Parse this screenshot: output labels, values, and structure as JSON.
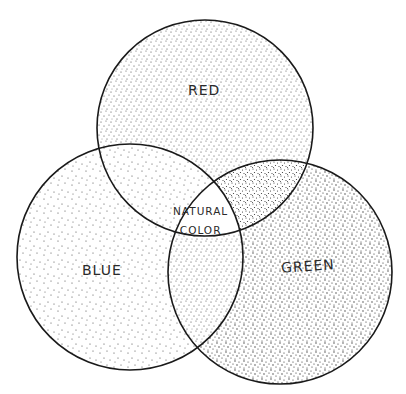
{
  "diagram": {
    "type": "venn",
    "sets": [
      {
        "id": "red",
        "label": "RED",
        "center": [
          205,
          128
        ],
        "radius": 108
      },
      {
        "id": "blue",
        "label": "BLUE",
        "center": [
          130,
          257
        ],
        "radius": 113
      },
      {
        "id": "green",
        "label": "GREEN",
        "center": [
          280,
          272
        ],
        "radius": 112
      }
    ],
    "intersection": {
      "label_line1": "NATURAL",
      "label_line2": "COLOR"
    },
    "style": {
      "stroke_color": "#1a1a1a",
      "stipple_color": "#3a3a3a",
      "background": "#ffffff",
      "center_fill": "#ffffff"
    }
  }
}
